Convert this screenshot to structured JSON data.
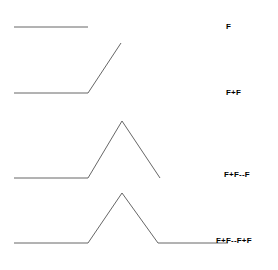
{
  "figure": {
    "name": "koch-lsystem-production-steps",
    "background_color": "#ffffff",
    "stroke_color": "#555555",
    "stroke_width": 0.9,
    "width": 278,
    "height": 270
  },
  "rows": [
    {
      "id": "step-0",
      "label": "F",
      "order": 0,
      "description": "single straight segment (axiom)",
      "points": [
        [
          14,
          27
        ],
        [
          88,
          27
        ]
      ]
    },
    {
      "id": "step-1",
      "label": "F+F",
      "order": 1,
      "description": "straight segment followed by one left turn of 60 degrees",
      "points": [
        [
          14,
          93
        ],
        [
          88,
          93
        ],
        [
          121,
          43
        ]
      ]
    },
    {
      "id": "step-2",
      "label": "F+F--F",
      "order": 2,
      "description": "segment, left turn, then two right turns forming a peak",
      "points": [
        [
          14,
          178
        ],
        [
          88,
          178
        ],
        [
          122,
          121
        ],
        [
          160,
          178
        ]
      ]
    },
    {
      "id": "step-3",
      "label": "F+F--F+F",
      "order": 3,
      "description": "complete Koch curve generator with peak and closing segment",
      "points": [
        [
          14,
          243
        ],
        [
          88,
          243
        ],
        [
          122,
          193
        ],
        [
          158,
          243
        ],
        [
          228,
          243
        ]
      ]
    }
  ],
  "chart_data": {
    "type": "line",
    "title": "",
    "xlabel": "",
    "ylabel": "",
    "grid": false,
    "legend": "right",
    "xlim": [
      0,
      278
    ],
    "ylim": [
      270,
      0
    ],
    "series": [
      {
        "name": "F",
        "x": [
          14,
          88
        ],
        "y": [
          27,
          27
        ]
      },
      {
        "name": "F+F",
        "x": [
          14,
          88,
          121
        ],
        "y": [
          93,
          93,
          43
        ]
      },
      {
        "name": "F+F--F",
        "x": [
          14,
          88,
          122,
          160
        ],
        "y": [
          178,
          178,
          121,
          178
        ]
      },
      {
        "name": "F+F--F+F",
        "x": [
          14,
          88,
          122,
          158,
          228
        ],
        "y": [
          243,
          243,
          193,
          243,
          243
        ]
      }
    ]
  }
}
